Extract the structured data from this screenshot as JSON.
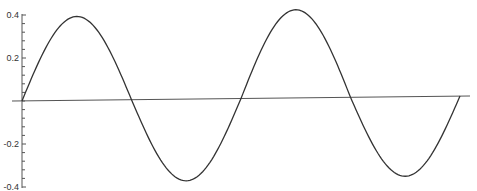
{
  "chart_data": {
    "type": "line",
    "title": "",
    "xlabel": "",
    "ylabel": "",
    "ylim": [
      -0.4,
      0.4
    ],
    "yticks": [
      0.4,
      0.2,
      -0.2,
      -0.4
    ],
    "ytick_labels": [
      "0.4",
      "0.2",
      "-0.2",
      "-0.4"
    ],
    "y_minor_tick_step": 0.04,
    "grid": false,
    "legend": null,
    "series": [
      {
        "name": "wave",
        "color": "#333333",
        "description": "Sinusoid starting at origin, ~2 full periods, slightly varying amplitude",
        "x": [
          0,
          0.5,
          1.0,
          1.5,
          2.0,
          2.5,
          3.0,
          3.5,
          4.0
        ],
        "y": [
          0.0,
          0.39,
          0.0,
          -0.38,
          0.0,
          0.41,
          0.0,
          -0.37,
          0.0
        ]
      }
    ],
    "axis_line": {
      "color": "#555555",
      "y": 0,
      "slight_tilt": true
    }
  },
  "pixel_map": {
    "origin_x": 22,
    "origin_y": 101,
    "px_per_x_unit": 109.5,
    "px_per_y_unit": 215,
    "axis_end_x": 470,
    "axis_start_x": 12,
    "axis_end_y": 96
  }
}
